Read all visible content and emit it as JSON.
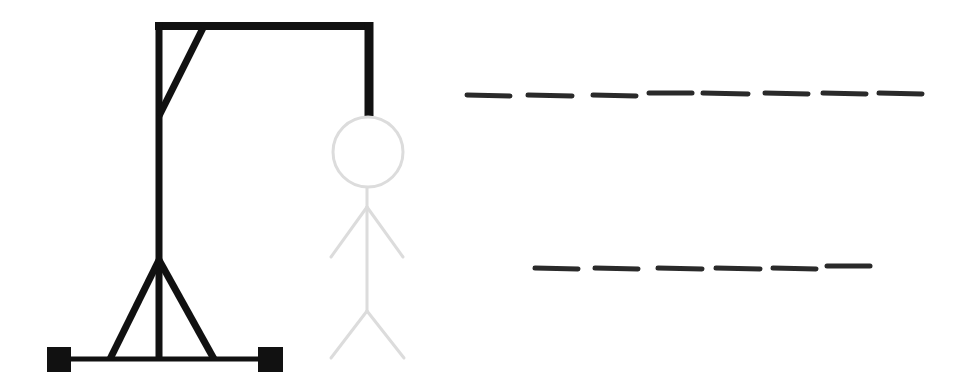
{
  "game": {
    "type": "hangman",
    "colors": {
      "background": "#ffffff",
      "gallows": "#111111",
      "figure": "#dcdcdc",
      "blank": "#2a2a2a"
    },
    "gallows": {
      "top_beam": {
        "x1": 155,
        "y1": 26,
        "x2": 373,
        "y2": 26,
        "width": 8
      },
      "pole": {
        "x1": 159,
        "y1": 22,
        "x2": 159,
        "y2": 360,
        "width": 7
      },
      "brace": {
        "x1": 203,
        "y1": 28,
        "x2": 159,
        "y2": 116,
        "width": 7
      },
      "rope": {
        "x1": 369,
        "y1": 22,
        "x2": 369,
        "y2": 116,
        "width": 9
      },
      "base": {
        "x1": 60,
        "y1": 359,
        "x2": 272,
        "y2": 359,
        "width": 5
      },
      "left_leg": {
        "x1": 159,
        "y1": 260,
        "x2": 110,
        "y2": 359,
        "width": 7
      },
      "right_leg": {
        "x1": 159,
        "y1": 260,
        "x2": 214,
        "y2": 359,
        "width": 7
      },
      "left_foot": {
        "x": 47,
        "y": 347,
        "w": 24,
        "h": 25
      },
      "right_foot": {
        "x": 258,
        "y": 347,
        "w": 25,
        "h": 25
      }
    },
    "figure": {
      "head": {
        "cx": 368,
        "cy": 152,
        "r": 35
      },
      "body": {
        "x1": 367,
        "y1": 188,
        "x2": 367,
        "y2": 311
      },
      "left_arm": {
        "x1": 367,
        "y1": 207,
        "x2": 331,
        "y2": 257
      },
      "right_arm": {
        "x1": 367,
        "y1": 207,
        "x2": 403,
        "y2": 257
      },
      "left_leg": {
        "x1": 367,
        "y1": 311,
        "x2": 331,
        "y2": 358
      },
      "right_leg": {
        "x1": 367,
        "y1": 311,
        "x2": 404,
        "y2": 358
      },
      "stroke_width": 3
    },
    "words": [
      {
        "letters": 8,
        "revealed": [
          "",
          "",
          "",
          "",
          "",
          "",
          "",
          ""
        ],
        "blanks": [
          {
            "x1": 467,
            "x2": 510,
            "y1": 95,
            "y2": 96
          },
          {
            "x1": 528,
            "x2": 572,
            "y1": 95,
            "y2": 96
          },
          {
            "x1": 593,
            "x2": 636,
            "y1": 95,
            "y2": 96
          },
          {
            "x1": 649,
            "x2": 692,
            "y1": 93,
            "y2": 93
          },
          {
            "x1": 703,
            "x2": 748,
            "y1": 93,
            "y2": 94
          },
          {
            "x1": 765,
            "x2": 808,
            "y1": 93,
            "y2": 94
          },
          {
            "x1": 823,
            "x2": 866,
            "y1": 93,
            "y2": 94
          },
          {
            "x1": 879,
            "x2": 922,
            "y1": 93,
            "y2": 94
          }
        ]
      },
      {
        "letters": 6,
        "revealed": [
          "",
          "",
          "",
          "",
          "",
          ""
        ],
        "blanks": [
          {
            "x1": 535,
            "x2": 578,
            "y1": 268,
            "y2": 269
          },
          {
            "x1": 595,
            "x2": 638,
            "y1": 268,
            "y2": 269
          },
          {
            "x1": 658,
            "x2": 702,
            "y1": 268,
            "y2": 269
          },
          {
            "x1": 716,
            "x2": 760,
            "y1": 268,
            "y2": 269
          },
          {
            "x1": 773,
            "x2": 816,
            "y1": 268,
            "y2": 269
          },
          {
            "x1": 827,
            "x2": 870,
            "y1": 266,
            "y2": 266
          }
        ]
      }
    ]
  }
}
